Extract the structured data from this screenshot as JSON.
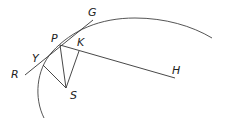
{
  "diagram": {
    "type": "geometry",
    "labels": {
      "G": "G",
      "P": "P",
      "K": "K",
      "Y": "Y",
      "R": "R",
      "S": "S",
      "H": "H"
    },
    "points": {
      "P": [
        60,
        45
      ],
      "K": [
        79,
        51
      ],
      "Y": [
        43,
        65
      ],
      "S": [
        66,
        88
      ],
      "G_end": [
        93,
        20
      ],
      "R_end": [
        25,
        75
      ],
      "H_end": [
        175,
        78
      ]
    },
    "colors": {
      "line": "#333333",
      "curve": "#555555",
      "text": "#222222"
    }
  }
}
